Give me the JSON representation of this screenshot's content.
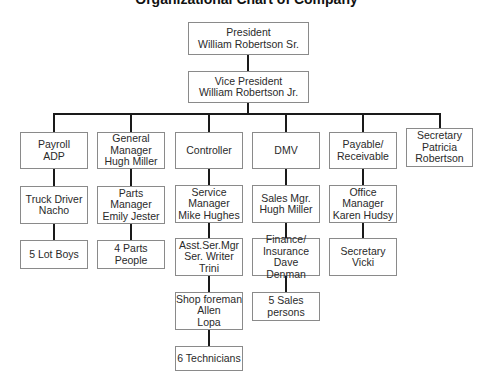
{
  "title": "Organizational Chart of Company",
  "top": {
    "president": "President\nWilliam Robertson Sr.",
    "vice_president": "Vice President\nWilliam Robertson Jr."
  },
  "columns": [
    {
      "head": "Payroll\nADP",
      "children": [
        "Truck Driver\nNacho",
        "5 Lot Boys"
      ]
    },
    {
      "head": "General\nManager\nHugh Miller",
      "children": [
        "Parts\nManager\nEmily Jester",
        "4 Parts People"
      ]
    },
    {
      "head": "Controller",
      "children": [
        "Service\nManager\nMike Hughes",
        "Asst.Ser.Mgr\nSer. Writer\nTrini",
        "Shop foreman\nAllen\nLopa",
        "6 Technicians"
      ]
    },
    {
      "head": "DMV",
      "children": [
        "Sales Mgr.\nHugh Miller",
        "Finance/\nInsurance\nDave Denman",
        "5 Sales\npersons"
      ]
    },
    {
      "head": "Payable/\nReceivable",
      "children": [
        "Office\nManager\nKaren Hudsy",
        "Secretary\nVicki"
      ]
    },
    {
      "head": "Secretary\nPatricia\nRobertson",
      "children": []
    }
  ]
}
